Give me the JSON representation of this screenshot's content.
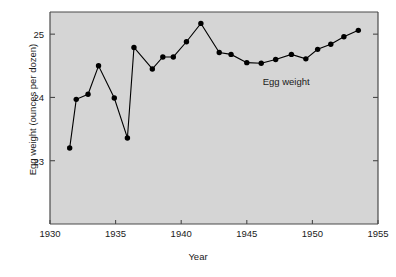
{
  "chart_data": {
    "type": "line",
    "title": "",
    "xlabel": "Year",
    "ylabel": "Egg weight (ounces per dozen)",
    "xlim": [
      1930,
      1955
    ],
    "ylim": [
      22.0,
      25.35
    ],
    "xticks": [
      1930,
      1935,
      1940,
      1945,
      1950,
      1955
    ],
    "yticks": [
      23,
      24,
      25
    ],
    "grid": false,
    "legend": "none",
    "annotations": [
      {
        "text": "Egg weight",
        "x": 1948.0,
        "y": 24.25
      }
    ],
    "series": [
      {
        "name": "Egg weight",
        "marker": "filled-circle",
        "color": "#000000",
        "x": [
          1931.5,
          1932.0,
          1932.9,
          1933.7,
          1934.9,
          1935.9,
          1936.4,
          1937.8,
          1938.6,
          1939.4,
          1940.4,
          1941.5,
          1942.9,
          1943.8,
          1945.0,
          1946.1,
          1947.2,
          1948.4,
          1949.5,
          1950.4,
          1951.4,
          1952.4,
          1953.5
        ],
        "y": [
          23.2,
          23.97,
          24.05,
          24.5,
          23.99,
          23.36,
          24.79,
          24.45,
          24.64,
          24.64,
          24.88,
          25.17,
          24.71,
          24.68,
          24.55,
          24.54,
          24.6,
          24.68,
          24.61,
          24.76,
          24.84,
          24.96,
          25.06
        ]
      }
    ]
  },
  "axes": {
    "plot_background": "#d5d5d5",
    "frame_color": "#4a4a4a"
  }
}
